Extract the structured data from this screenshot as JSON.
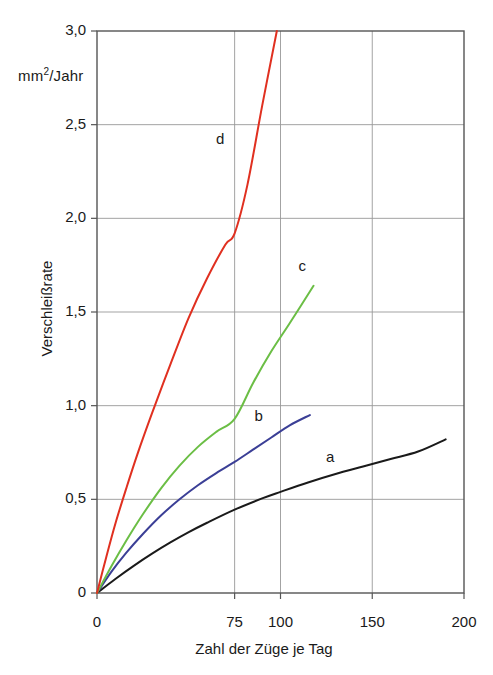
{
  "chart_data": {
    "type": "line",
    "title": "",
    "xlabel": "Zahl der Züge je Tag",
    "ylabel": "Verschleißrate",
    "yunit": "mm ²/Jahr",
    "yunit_base": "mm",
    "yunit_exp": "2",
    "yunit_tail": "/Jahr",
    "xlim": [
      0,
      200
    ],
    "ylim": [
      0,
      3.0
    ],
    "grid": true,
    "legend_position": "inline-labels",
    "xticks": [
      0,
      75,
      100,
      150,
      200
    ],
    "xticklabels": [
      "0",
      "75",
      "100",
      "150",
      "200"
    ],
    "yticks": [
      0,
      0.5,
      1.0,
      1.5,
      2.0,
      2.5,
      3.0
    ],
    "yticklabels": [
      "0",
      "0,5",
      "1,0",
      "1,5",
      "2,0",
      "2,5",
      "3,0"
    ],
    "series": [
      {
        "name": "a",
        "label": "a",
        "color": "#1a1a1a",
        "label_x": 127,
        "label_y": 0.72,
        "x": [
          0,
          10,
          20,
          30,
          40,
          50,
          60,
          75,
          90,
          100,
          115,
          130,
          145,
          160,
          175,
          190
        ],
        "y": [
          0,
          0.075,
          0.145,
          0.21,
          0.27,
          0.325,
          0.375,
          0.445,
          0.505,
          0.54,
          0.59,
          0.635,
          0.675,
          0.715,
          0.755,
          0.82
        ]
      },
      {
        "name": "b",
        "label": "b",
        "color": "#3b3f96",
        "label_x": 88,
        "label_y": 0.94,
        "x": [
          0,
          8,
          16,
          25,
          35,
          45,
          55,
          65,
          75,
          85,
          95,
          105,
          116
        ],
        "y": [
          0,
          0.115,
          0.215,
          0.315,
          0.415,
          0.5,
          0.575,
          0.64,
          0.7,
          0.765,
          0.83,
          0.895,
          0.95
        ]
      },
      {
        "name": "c",
        "label": "c",
        "color": "#6bbe45",
        "label_x": 112,
        "label_y": 1.74,
        "x": [
          0,
          8,
          16,
          25,
          35,
          45,
          55,
          65,
          75,
          85,
          95,
          105,
          118
        ],
        "y": [
          0,
          0.145,
          0.28,
          0.42,
          0.56,
          0.68,
          0.78,
          0.86,
          0.93,
          1.12,
          1.29,
          1.44,
          1.64
        ]
      },
      {
        "name": "d",
        "label": "d",
        "color": "#e03020",
        "label_x": 67,
        "label_y": 2.42,
        "x": [
          0,
          5,
          10,
          16,
          22,
          30,
          40,
          50,
          60,
          70,
          75,
          82,
          90,
          98
        ],
        "y": [
          0,
          0.19,
          0.37,
          0.56,
          0.74,
          0.96,
          1.22,
          1.47,
          1.68,
          1.86,
          1.92,
          2.18,
          2.6,
          3.0
        ]
      }
    ]
  },
  "axes": {
    "frame_color": "#555555",
    "grid_color": "#999999"
  }
}
